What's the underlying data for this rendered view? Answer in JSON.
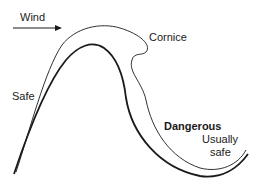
{
  "diagram": {
    "labels": {
      "wind": "Wind",
      "cornice": "Cornice",
      "safe": "Safe",
      "dangerous": "Dangerous",
      "usually_safe_line1": "Usually",
      "usually_safe_line2": "safe"
    },
    "elements": {
      "wind_arrow": "arrow-right-icon",
      "snow_surface": "thin outer curve with overhanging cornice",
      "ground_ridge": "thick inner curve (ridge profile)"
    },
    "colors": {
      "line": "#1a1a1a",
      "background": "#ffffff"
    }
  }
}
